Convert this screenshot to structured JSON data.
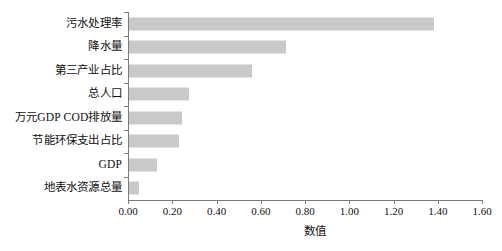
{
  "chart_data": {
    "type": "bar",
    "orientation": "horizontal",
    "title": "",
    "xlabel": "数值",
    "ylabel": "",
    "xlim": [
      0.0,
      1.6
    ],
    "xticks": [
      "0.00",
      "0.20",
      "0.40",
      "0.60",
      "0.80",
      "1.00",
      "1.20",
      "1.40",
      "1.60"
    ],
    "xtick_values": [
      0.0,
      0.2,
      0.4,
      0.6,
      0.8,
      1.0,
      1.2,
      1.4,
      1.6
    ],
    "grid": false,
    "legend": false,
    "bar_color": "#c9c9c9",
    "axis_color": "#7a7a7a",
    "categories": [
      "污水处理率",
      "降水量",
      "第三产业占比",
      "总人口",
      "万元GDP COD排放量",
      "节能环保支出占比",
      "GDP",
      "地表水资源总量"
    ],
    "values": [
      1.38,
      0.71,
      0.555,
      0.27,
      0.24,
      0.225,
      0.125,
      0.045
    ]
  }
}
